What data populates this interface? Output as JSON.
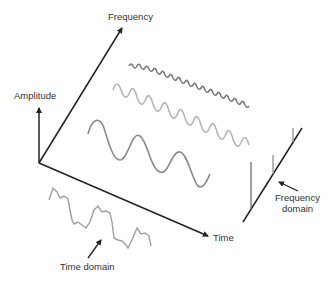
{
  "diagram": {
    "axes": {
      "amplitude_label": "Amplitude",
      "frequency_label": "Frequency",
      "time_label": "Time"
    },
    "annotations": {
      "time_domain_label": "Time domain",
      "frequency_domain_label_line1": "Frequency",
      "frequency_domain_label_line2": "domain"
    },
    "colors": {
      "axis": "#222222",
      "wave_low": "#8a8a8a",
      "wave_mid": "#b5b5b5",
      "wave_high": "#7a7a7a",
      "composite": "#a0a0a0",
      "spectrum": "#777777"
    },
    "components": [
      {
        "name": "low-frequency sine",
        "cycles": 3
      },
      {
        "name": "mid-frequency sine",
        "cycles": 8
      },
      {
        "name": "high-frequency sine",
        "cycles": 16
      }
    ]
  }
}
